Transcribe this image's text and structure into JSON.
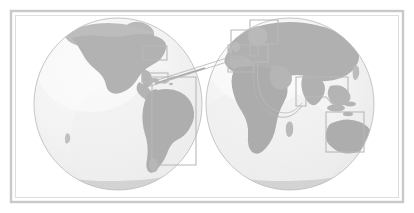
{
  "figure": {
    "kind": "world-map",
    "title": "World map with two hemisphere globes",
    "projection": "orthographic-double-hemisphere",
    "orientation": "landscape"
  },
  "canvas": {
    "width": 414,
    "height": 213,
    "background": "#ffffff"
  },
  "frame": {
    "name": "outer-border-frame",
    "style": "double-line",
    "inset": 10,
    "outer_color": "#c8c8c8",
    "inner_color": "#dcdcdc",
    "outer_width": 2,
    "inner_width": 1,
    "gap": 2,
    "fill": "#ffffff"
  },
  "palette": {
    "ocean": "#f2f2f2",
    "ocean_shade": "#ededed",
    "ocean_highlight": "#f8f8f8",
    "land": "#b4b4b4",
    "land_light": "#c4c4c4",
    "ice_cap": "#d2d2d2",
    "globe_outline": "#bdbdbd",
    "callout_stroke": "#b8b8b8",
    "connector_stroke": "#b0b0b0",
    "page_background": "#ffffff"
  },
  "globes": [
    {
      "id": "globe-west",
      "name": "western-hemisphere-globe",
      "label": "Western Hemisphere",
      "center_x": 118,
      "center_y": 104,
      "radius_x": 84,
      "radius_y": 86,
      "continents": [
        "North America",
        "Central America",
        "South America",
        "Greenland",
        "Antarctica"
      ]
    },
    {
      "id": "globe-east",
      "name": "eastern-hemisphere-globe",
      "label": "Eastern Hemisphere",
      "center_x": 290,
      "center_y": 104,
      "radius_x": 84,
      "radius_y": 86,
      "continents": [
        "Europe",
        "Africa",
        "Asia",
        "Australia",
        "Antarctica"
      ]
    }
  ],
  "regions": [
    {
      "id": "region-northeast-usa",
      "name": "region-box-northeast-usa",
      "label": "Northeast North America",
      "shape": "rect",
      "x": 143,
      "y": 46,
      "width": 24,
      "height": 14,
      "globe": "globe-west"
    },
    {
      "id": "region-americas",
      "name": "region-box-americas",
      "label": "Caribbean and South America",
      "shape": "polygon",
      "points": "142,77 196,77 196,165 152,165 152,82 142,82",
      "globe": "globe-west"
    },
    {
      "id": "region-north-atlantic",
      "name": "region-box-north-atlantic",
      "label": "North Atlantic corridor",
      "shape": "rect",
      "x": 142,
      "y": 73,
      "width": 26,
      "height": 9,
      "globe": "globe-west"
    },
    {
      "id": "region-northern-europe",
      "name": "region-box-northern-europe",
      "label": "Northern Europe and Scandinavia",
      "shape": "polygon",
      "points": "250,20 278,20 278,44 258,44 258,56 250,56",
      "globe": "globe-east"
    },
    {
      "id": "region-western-europe",
      "name": "region-box-western-europe",
      "label": "Western and Central Europe",
      "shape": "polygon",
      "points": "231,30 258,30 258,44 268,44 268,62 231,62",
      "globe": "globe-east"
    },
    {
      "id": "region-mediterranean",
      "name": "region-box-mediterranean",
      "label": "Mediterranean and Middle East",
      "shape": "polygon",
      "points": "228,45 268,45 268,62 254,62 254,72 228,72",
      "globe": "globe-east"
    },
    {
      "id": "region-south-asia",
      "name": "region-box-south-asia",
      "label": "South and Southeast Asia",
      "shape": "polygon",
      "points": "296,77 348,77 348,97 336,108 326,97 306,97 306,106 296,106",
      "globe": "globe-east"
    },
    {
      "id": "region-australia",
      "name": "region-box-australia",
      "label": "Australia and Oceania",
      "shape": "rect",
      "x": 326,
      "y": 112,
      "width": 38,
      "height": 40,
      "globe": "globe-east"
    }
  ],
  "connectors": [
    {
      "id": "connector-transatlantic",
      "name": "connector-line-transatlantic",
      "label": "Americas to Europe connector",
      "type": "wedge",
      "from": "region-north-atlantic",
      "to": "region-western-europe"
    },
    {
      "id": "connector-indian-ocean",
      "name": "connector-line-indian-ocean",
      "label": "Europe to Asia-Pacific curved connector",
      "type": "curve",
      "from": "region-mediterranean",
      "to": "region-south-asia"
    }
  ],
  "accessibility": {
    "alt_text": "Grayscale double-hemisphere world map with highlighted regions in North America, South America, Europe, the Mediterranean, South Asia and Australia, connected by thin lines.",
    "caption": "World map with two hemisphere globes"
  }
}
